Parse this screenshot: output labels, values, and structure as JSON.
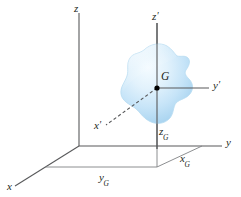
{
  "figure": {
    "background_color": "#ffffff",
    "axis_color": "#58595b",
    "label_color": "#231f20",
    "body_fill_light": "#eaf4fb",
    "body_fill_mid": "#cde6f7",
    "body_fill_dark": "#a9d3ef",
    "body_stroke": "#bcdff2",
    "point_color": "#000000"
  },
  "labels": {
    "z_axis": "z",
    "z_prime_axis": "z",
    "z_prime_mark": "′",
    "y_axis": "y",
    "y_prime_axis": "y",
    "y_prime_mark": "′",
    "x_axis": "x",
    "x_prime_axis": "x",
    "x_prime_mark": "′",
    "center_of_mass": "G",
    "z_G_base": "z",
    "z_G_sub": "G",
    "y_G_base": "y",
    "y_G_sub": "G",
    "x_G_base": "x",
    "x_G_sub": "G"
  },
  "geometry": {
    "origin": [
      79,
      146
    ],
    "center_of_mass_point": [
      157,
      88
    ],
    "z_axis_top": [
      79,
      12
    ],
    "y_axis_end": [
      224,
      146
    ],
    "x_axis_end": [
      14,
      188
    ],
    "z_prime_top": [
      157,
      22
    ],
    "z_prime_bottom": [
      157,
      149
    ],
    "y_prime_end": [
      210,
      88
    ],
    "x_prime_end": [
      105,
      127
    ]
  }
}
